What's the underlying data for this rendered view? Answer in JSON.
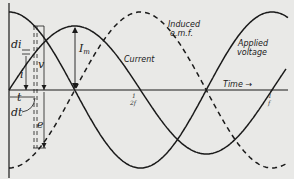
{
  "figure": {
    "background": "#e9e9e7",
    "ink": "#1a1a1a",
    "labels": {
      "induced_emf_line1": "Induced",
      "induced_emf_line2": "e.m.f.",
      "applied_voltage_line1": "Applied",
      "applied_voltage_line2": "voltage",
      "current": "Current",
      "time": "Time",
      "time_arrow": "→",
      "peak_current": "I",
      "peak_current_sub": "m",
      "voltage_symbol": "v",
      "emf_symbol": "e",
      "current_symbol": "i",
      "di": "di",
      "t": "t",
      "dt": "dt",
      "half_period_num": "1",
      "half_period_den": "2f",
      "period_num": "1",
      "period_den": "f"
    },
    "curves": [
      {
        "name": "Current",
        "style": "solid",
        "phase": "sin"
      },
      {
        "name": "Applied voltage",
        "style": "solid",
        "phase": "cos"
      },
      {
        "name": "Induced e.m.f.",
        "style": "dashed",
        "phase": "-cos"
      }
    ]
  }
}
